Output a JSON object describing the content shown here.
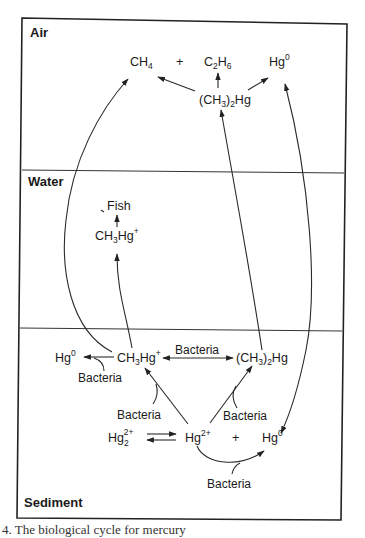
{
  "diagram": {
    "title": "Biological cycle for mercury",
    "zones": {
      "air": "Air",
      "water": "Water",
      "sediment": "Sediment"
    },
    "air": {
      "ch4": {
        "base": "CH",
        "sub": "4"
      },
      "plus1": "+",
      "c2h6": {
        "p1": "C",
        "s1": "2",
        "p2": "H",
        "s2": "6"
      },
      "hg0": {
        "base": "Hg",
        "sup": "0"
      },
      "dimethylmercury": {
        "p1": "(CH",
        "s1": "3",
        "p2": ")",
        "s2": "2",
        "p3": "Hg"
      }
    },
    "water": {
      "fish": "Fish",
      "methylmercury": {
        "p1": "CH",
        "s1": "3",
        "p2": "Hg",
        "sup": "+"
      }
    },
    "sediment": {
      "hg0_left": {
        "base": "Hg",
        "sup": "0"
      },
      "methylmercury": {
        "p1": "CH",
        "s1": "3",
        "p2": "Hg",
        "sup": "+"
      },
      "dimethylmercury": {
        "p1": "(CH",
        "s1": "3",
        "p2": ")",
        "s2": "2",
        "p3": "Hg"
      },
      "hg22": {
        "base": "Hg",
        "sub": "2",
        "sup": "2+"
      },
      "hg2": {
        "base": "Hg",
        "sup": "2+"
      },
      "plus": "+",
      "hg0_right": {
        "base": "Hg",
        "sup": "0"
      },
      "bacteria_labels": [
        "Bacteria",
        "Bacteria",
        "Bacteria",
        "Bacteria",
        "Bacteria"
      ]
    },
    "caption": "4.  The biological cycle for mercury"
  }
}
